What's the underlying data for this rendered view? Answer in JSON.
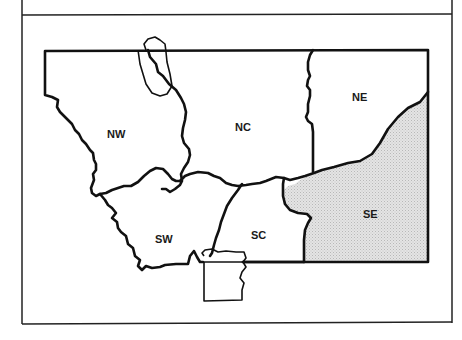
{
  "map": {
    "title": "",
    "regions": [
      {
        "id": "NW",
        "label": "NW",
        "x": 117,
        "y": 134,
        "shaded": false
      },
      {
        "id": "NC",
        "label": "NC",
        "x": 243,
        "y": 127,
        "shaded": false
      },
      {
        "id": "NE",
        "label": "NE",
        "x": 361,
        "y": 99,
        "shaded": false
      },
      {
        "id": "SW",
        "label": "SW",
        "x": 170,
        "y": 240,
        "shaded": false
      },
      {
        "id": "SC",
        "label": "SC",
        "x": 260,
        "y": 236,
        "shaded": false
      },
      {
        "id": "SE",
        "label": "SE",
        "x": 372,
        "y": 214,
        "shaded": true
      }
    ],
    "colors": {
      "outline": "#111111",
      "shaded_fill": "#d9d9d9",
      "background": "#ffffff"
    }
  }
}
